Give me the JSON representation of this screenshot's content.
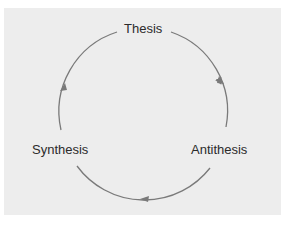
{
  "diagram": {
    "type": "cycle",
    "nodes": [
      {
        "id": "thesis",
        "label": "Thesis"
      },
      {
        "id": "antithesis",
        "label": "Antithesis"
      },
      {
        "id": "synthesis",
        "label": "Synthesis"
      }
    ],
    "edges": [
      {
        "from": "thesis",
        "to": "antithesis",
        "direction": "clockwise"
      },
      {
        "from": "antithesis",
        "to": "synthesis",
        "direction": "clockwise"
      },
      {
        "from": "synthesis",
        "to": "thesis",
        "direction": "clockwise"
      }
    ],
    "colors": {
      "background": "#ededed",
      "arrow": "#7a7a7a",
      "text": "#2b2b2b"
    }
  }
}
